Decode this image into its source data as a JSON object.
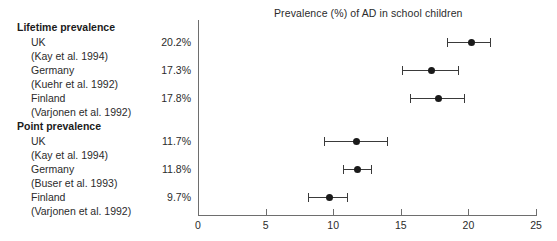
{
  "chart_data": {
    "type": "scatter",
    "title": "Prevalence (%) of AD in school children",
    "xlabel": "",
    "ylabel": "",
    "xlim": [
      0,
      25
    ],
    "xticks": [
      0,
      5,
      10,
      15,
      20,
      25
    ],
    "xtick_labels": [
      "0",
      "5",
      "10",
      "15",
      "20",
      "25"
    ],
    "grid": false,
    "legend": "none",
    "orientation": "horizontal",
    "groups": [
      {
        "header": "Lifetime prevalence",
        "rows": [
          {
            "country": "UK",
            "citation": "(Kay et al. 1994)",
            "value_label": "20.2%",
            "value": 20.2,
            "ci_low": 18.4,
            "ci_high": 21.6
          },
          {
            "country": "Germany",
            "citation": "(Kuehr et al. 1992)",
            "value_label": "17.3%",
            "value": 17.3,
            "ci_low": 15.1,
            "ci_high": 19.2
          },
          {
            "country": "Finland",
            "citation": "(Varjonen et al. 1992)",
            "value_label": "17.8%",
            "value": 17.8,
            "ci_low": 15.7,
            "ci_high": 19.7
          }
        ]
      },
      {
        "header": "Point prevalence",
        "rows": [
          {
            "country": "UK",
            "citation": "(Kay et al. 1994)",
            "value_label": "11.7%",
            "value": 11.7,
            "ci_low": 9.3,
            "ci_high": 14.0
          },
          {
            "country": "Germany",
            "citation": "(Buser et al. 1993)",
            "value_label": "11.8%",
            "value": 11.8,
            "ci_low": 10.7,
            "ci_high": 12.8
          },
          {
            "country": "Finland",
            "citation": "(Varjonen et al. 1992)",
            "value_label": "9.7%",
            "value": 9.7,
            "ci_low": 8.1,
            "ci_high": 11.0
          }
        ]
      }
    ],
    "colors": {
      "marker": "#1a1a1a",
      "error_bar": "#3a3a3a",
      "axis": "#6e6e6e",
      "text": "#2b2b2b",
      "background": "#ffffff"
    }
  }
}
